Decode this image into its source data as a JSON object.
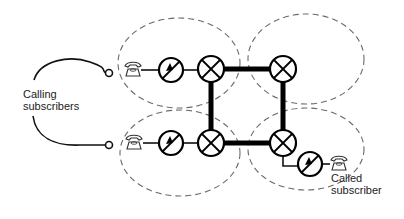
{
  "diagram": {
    "labels": {
      "calling_line1": "Calling",
      "calling_line2": "subscribers",
      "called_line1": "Called",
      "called_line2": "subscriber"
    },
    "zones": [
      {
        "name": "zone-top-left",
        "cx": 179,
        "cy": 63,
        "rx": 61,
        "ry": 45
      },
      {
        "name": "zone-top-right",
        "cx": 306,
        "cy": 59,
        "rx": 58,
        "ry": 45
      },
      {
        "name": "zone-bottom-left",
        "cx": 180,
        "cy": 153,
        "rx": 60,
        "ry": 43
      },
      {
        "name": "zone-bottom-right",
        "cx": 306,
        "cy": 149,
        "rx": 58,
        "ry": 41
      }
    ],
    "switches": [
      {
        "name": "switch-top-left",
        "cx": 211,
        "cy": 69
      },
      {
        "name": "switch-top-right",
        "cx": 283,
        "cy": 69
      },
      {
        "name": "switch-bottom-left",
        "cx": 211,
        "cy": 143
      },
      {
        "name": "switch-bottom-right",
        "cx": 283,
        "cy": 143
      }
    ],
    "meters": [
      {
        "name": "meter-calling-top",
        "cx": 171,
        "cy": 70
      },
      {
        "name": "meter-calling-bottom",
        "cx": 171,
        "cy": 143
      },
      {
        "name": "meter-called",
        "cx": 310,
        "cy": 164
      }
    ],
    "colors": {
      "background": "#ffffff",
      "line": "#000000",
      "dashed": "#6a6a6a"
    }
  }
}
